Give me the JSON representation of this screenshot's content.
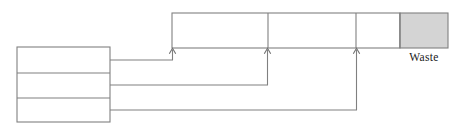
{
  "diagram": {
    "type": "block-flow-diagram",
    "canvas": {
      "width": 462,
      "height": 138,
      "background": "#ffffff"
    },
    "stroke_color": "#808080",
    "text_color": "#1a1a1a",
    "labels": {
      "waste": "Waste"
    },
    "source_stack": {
      "name": "source-stack",
      "x": 17,
      "y": 47,
      "width": 93,
      "height": 75,
      "fill": "#ffffff",
      "cells": [
        {
          "name": "source-cell-1",
          "label": "",
          "y": 47,
          "height": 26
        },
        {
          "name": "source-cell-2",
          "label": "",
          "y": 73,
          "height": 25
        },
        {
          "name": "source-cell-3",
          "label": "",
          "y": 98,
          "height": 24
        }
      ]
    },
    "top_bar": {
      "name": "process-bar",
      "x": 172,
      "y": 13,
      "width": 276,
      "height": 35,
      "dividers_x": [
        268,
        356,
        400
      ],
      "cells": [
        {
          "name": "process-cell-1",
          "label": "",
          "x": 172,
          "width": 96,
          "fill": "#ffffff"
        },
        {
          "name": "process-cell-2",
          "label": "",
          "x": 268,
          "width": 88,
          "fill": "#ffffff"
        },
        {
          "name": "process-cell-3",
          "label": "",
          "x": 356,
          "width": 44,
          "fill": "#ffffff"
        },
        {
          "name": "waste-cell",
          "label": "Waste",
          "x": 400,
          "width": 48,
          "fill": "#d4d4d4"
        }
      ]
    },
    "connections": [
      {
        "name": "connection-1",
        "from": "source-cell-1",
        "to": "process-cell-1",
        "path": "M110 60 L172.5 60 L172.5 49",
        "arrow": {
          "x": 172.5,
          "y": 48
        }
      },
      {
        "name": "connection-2",
        "from": "source-cell-2",
        "to": "process-cell-2",
        "path": "M110 85 L267.5 85 L267.5 49",
        "arrow": {
          "x": 267.5,
          "y": 48
        }
      },
      {
        "name": "connection-3",
        "from": "source-cell-3",
        "to": "process-cell-3",
        "path": "M110 110 L356.5 110 L356.5 49",
        "arrow": {
          "x": 356.5,
          "y": 48
        }
      }
    ]
  }
}
